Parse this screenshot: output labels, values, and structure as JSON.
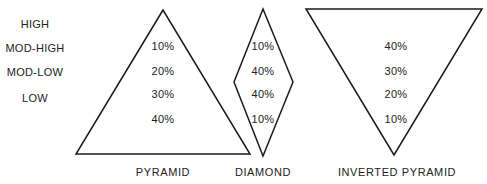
{
  "row_labels": [
    "HIGH",
    "MOD-HIGH",
    "MOD-LOW",
    "LOW"
  ],
  "shapes": {
    "pyramid": {
      "title": "PYRAMID",
      "values": [
        "10%",
        "20%",
        "30%",
        "40%"
      ]
    },
    "diamond": {
      "title": "DIAMOND",
      "values": [
        "10%",
        "40%",
        "40%",
        "10%"
      ]
    },
    "inverted_pyramid": {
      "title": "INVERTED PYRAMID",
      "values": [
        "40%",
        "30%",
        "20%",
        "10%"
      ]
    }
  },
  "colors": {
    "stroke": "#1a1a1a",
    "text": "#222222",
    "background": "#ffffff"
  }
}
